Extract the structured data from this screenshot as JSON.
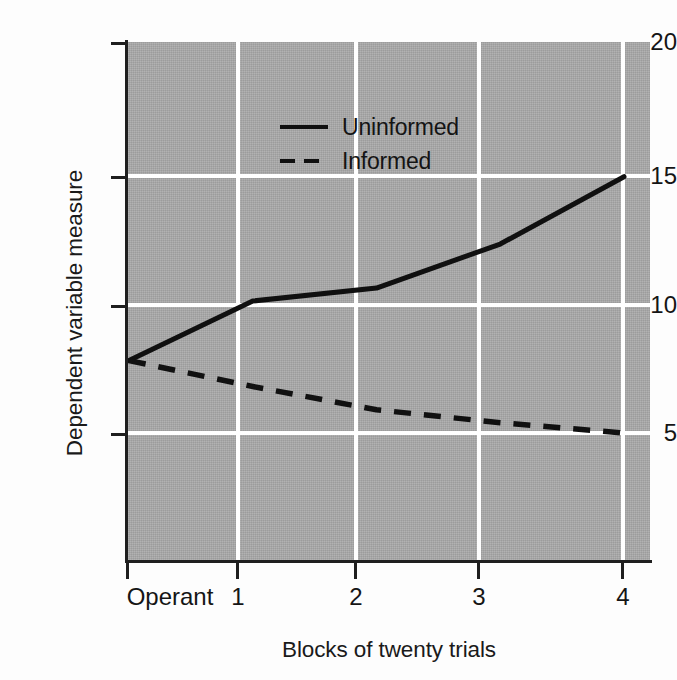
{
  "chart_data": {
    "type": "line",
    "title": "",
    "xlabel": "Blocks of twenty trials",
    "ylabel": "Dependent variable measure",
    "categories": [
      "Operant",
      "1",
      "2",
      "3",
      "4"
    ],
    "x": [
      0,
      1,
      2,
      3,
      4
    ],
    "xtick_labels": [
      "Operant",
      "1",
      "2",
      "3",
      "4"
    ],
    "ytick_labels": [
      "5",
      "10",
      "15",
      "20"
    ],
    "yticks": [
      5,
      10,
      15,
      20
    ],
    "ylim": [
      0,
      20
    ],
    "xlim": [
      0,
      4
    ],
    "grid": "white gridlines on gray panel",
    "legend_position": "inside top-left",
    "panel_color": "#a9a9a9",
    "gridline_color": "#ffffff",
    "line_color": "#101010",
    "series": [
      {
        "name": "Uninformed",
        "style": "solid",
        "values": [
          7.7,
          10.0,
          10.5,
          12.2,
          14.8
        ]
      },
      {
        "name": "Informed",
        "style": "dashed",
        "values": [
          7.7,
          6.7,
          5.8,
          5.3,
          4.9
        ]
      }
    ]
  },
  "axes": {
    "y_title": "Dependent variable measure",
    "x_title": "Blocks of twenty trials",
    "y_ticks": [
      {
        "label": "20",
        "value": 20
      },
      {
        "label": "15",
        "value": 15
      },
      {
        "label": "10",
        "value": 10
      },
      {
        "label": "5",
        "value": 5
      }
    ],
    "x_ticks": [
      {
        "label": "Operant",
        "value": 0
      },
      {
        "label": "1",
        "value": 1
      },
      {
        "label": "2",
        "value": 2
      },
      {
        "label": "3",
        "value": 3
      },
      {
        "label": "4",
        "value": 4
      }
    ]
  },
  "legend": {
    "items": [
      {
        "label": "Uninformed",
        "style": "solid"
      },
      {
        "label": "Informed",
        "style": "dashed"
      }
    ]
  }
}
